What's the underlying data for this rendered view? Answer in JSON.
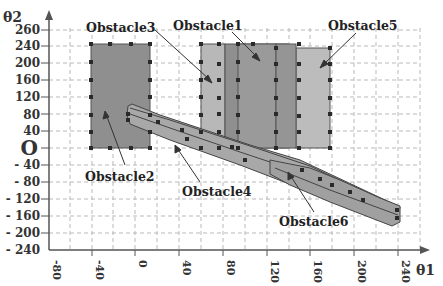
{
  "diagram": {
    "x_axis": {
      "title": "θ1",
      "ticks": [
        "-80",
        "-40",
        "0",
        "40",
        "80",
        "120",
        "160",
        "200",
        "240"
      ],
      "values": [
        -80,
        -40,
        0,
        40,
        80,
        120,
        160,
        200,
        240
      ]
    },
    "y_axis": {
      "title": "θ2",
      "ticks": [
        "260",
        "240",
        "200",
        "160",
        "120",
        "80",
        "40",
        "O",
        "- 40",
        "- 80",
        "- 120",
        "- 160",
        "- 200",
        "- 240"
      ],
      "values": [
        260,
        240,
        200,
        160,
        120,
        80,
        40,
        0,
        -40,
        -80,
        -120,
        -160,
        -200,
        -240
      ]
    },
    "obstacles": [
      {
        "name": "Obstacle1",
        "label": "Obstacle1",
        "theta1": [
          90,
          150
        ],
        "theta2": [
          0,
          240
        ],
        "fill": "#8f8f8f"
      },
      {
        "name": "Obstacle2",
        "label": "Obstacle2",
        "theta1": [
          -40,
          10
        ],
        "theta2": [
          0,
          240
        ],
        "fill": "#8f8f8f"
      },
      {
        "name": "Obstacle3",
        "label": "Obstacle3",
        "theta1": [
          60,
          90
        ],
        "theta2": [
          0,
          240
        ],
        "fill": "#b8b8b8"
      },
      {
        "name": "Obstacle4",
        "label": "Obstacle4",
        "shape": "diagonal band",
        "from": [
          -5,
          90
        ],
        "to": [
          240,
          -175
        ],
        "fill": "#a8a8a8"
      },
      {
        "name": "Obstacle5",
        "label": "Obstacle5",
        "theta1": [
          150,
          180
        ],
        "theta2": [
          0,
          235
        ],
        "fill": "#bcbcbc"
      },
      {
        "name": "Obstacle6",
        "label": "Obstacle6",
        "shape": "diagonal band",
        "from": [
          120,
          -40
        ],
        "to": [
          240,
          -185
        ],
        "fill": "#a0a0a0"
      }
    ],
    "colors": {
      "grid": "#b5b5b5",
      "axis": "#555555",
      "marker": "#2a2a2a"
    }
  }
}
